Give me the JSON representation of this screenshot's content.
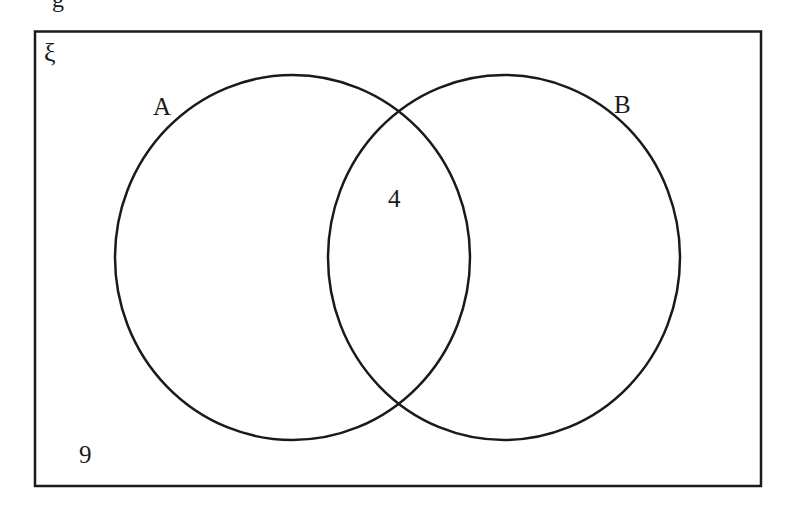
{
  "diagram": {
    "type": "venn",
    "universal_set_label": "ξ",
    "top_cut_text": "g",
    "sets": [
      {
        "name": "A",
        "label": "A"
      },
      {
        "name": "B",
        "label": "B"
      }
    ],
    "regions": {
      "A_only": "",
      "A_and_B": "4",
      "B_only": "",
      "outside": "9"
    },
    "colors": {
      "stroke": "#1a1a1a",
      "background": "#ffffff"
    }
  }
}
